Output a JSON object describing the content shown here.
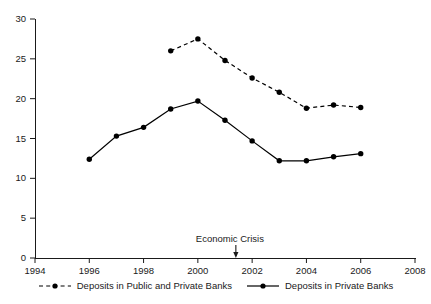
{
  "chart_data": {
    "type": "line",
    "title": "",
    "subtitle": "",
    "xlabel": "",
    "ylabel": "",
    "xlim": [
      1994,
      2008
    ],
    "ylim": [
      0,
      30
    ],
    "grid": false,
    "legend_position": "bottom",
    "x_ticks": [
      "1994",
      "1996",
      "1998",
      "2000",
      "2002",
      "2004",
      "2006",
      "2008"
    ],
    "x_tick_values": [
      1994,
      1996,
      1998,
      2000,
      2002,
      2004,
      2006,
      2008
    ],
    "y_ticks": [
      "0",
      "5",
      "10",
      "15",
      "20",
      "25",
      "30"
    ],
    "y_tick_values": [
      0,
      5,
      10,
      15,
      20,
      25,
      30
    ],
    "series": [
      {
        "name": "Deposits in Public and Private Banks",
        "style": "dashed",
        "marker": "filled-circle",
        "color": "#000000",
        "x": [
          1999,
          2000,
          2001,
          2002,
          2003,
          2004,
          2005,
          2006
        ],
        "values": [
          26.0,
          27.5,
          24.8,
          22.6,
          20.8,
          18.8,
          19.2,
          18.9
        ]
      },
      {
        "name": "Deposits in Private Banks",
        "style": "solid",
        "marker": "filled-circle",
        "color": "#000000",
        "x": [
          1996,
          1997,
          1998,
          1999,
          2000,
          2001,
          2002,
          2003,
          2004,
          2005,
          2006
        ],
        "values": [
          12.4,
          15.3,
          16.4,
          18.7,
          19.7,
          17.3,
          14.7,
          12.2,
          12.2,
          12.7,
          13.1
        ]
      }
    ],
    "annotations": [
      {
        "text": "Economic Crisis",
        "x": 2001.4,
        "y": 0,
        "arrow": "down"
      }
    ]
  },
  "legend": {
    "entries": [
      {
        "label": "Deposits in Public and Private Banks",
        "style": "dashed"
      },
      {
        "label": "Deposits in Private Banks",
        "style": "solid"
      }
    ]
  }
}
